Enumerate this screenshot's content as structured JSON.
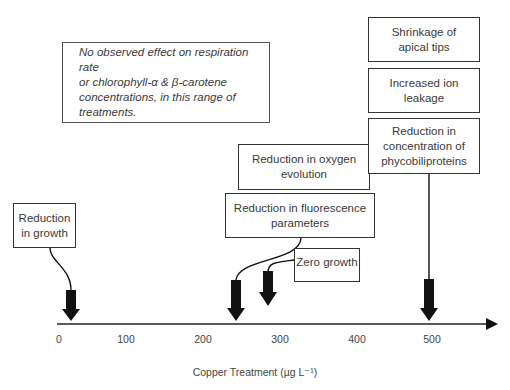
{
  "diagram": {
    "note": "No observed effect on respiration rate or chlorophyll-α & β-carotene concentrations, in this range of treatments.",
    "axis": {
      "label": "Copper Treatment (µg L⁻¹)",
      "ticks": [
        "0",
        "100",
        "200",
        "300",
        "400",
        "500"
      ]
    },
    "effects": [
      {
        "label": "Reduction in growth",
        "concentration": 20
      },
      {
        "label": "Reduction in oxygen evolution",
        "concentration": 240
      },
      {
        "label": "Reduction in fluorescence parameters",
        "concentration": 240
      },
      {
        "label": "Zero growth",
        "concentration": 280
      },
      {
        "label": "Shrinkage of apical tips",
        "concentration": 490
      },
      {
        "label": "Increased ion leakage",
        "concentration": 490
      },
      {
        "label": "Reduction in concentration of phycobiliproteins",
        "concentration": 490
      }
    ],
    "box_lines": {
      "growth": [
        "Reduction",
        "in growth"
      ],
      "oxygen": [
        "Reduction in oxygen",
        "evolution"
      ],
      "fluorescence": [
        "Reduction in fluorescence",
        "parameters"
      ],
      "zero": [
        "Zero growth"
      ],
      "apical": [
        "Shrinkage of",
        "apical tips"
      ],
      "ion": [
        "Increased ion",
        "leakage"
      ],
      "phyco": [
        "Reduction in",
        "concentration of",
        "phycobiliproteins"
      ],
      "note": [
        "No observed effect on respiration rate",
        "or chlorophyll-α & β-carotene",
        "concentrations, in this range of",
        "treatments."
      ]
    }
  }
}
